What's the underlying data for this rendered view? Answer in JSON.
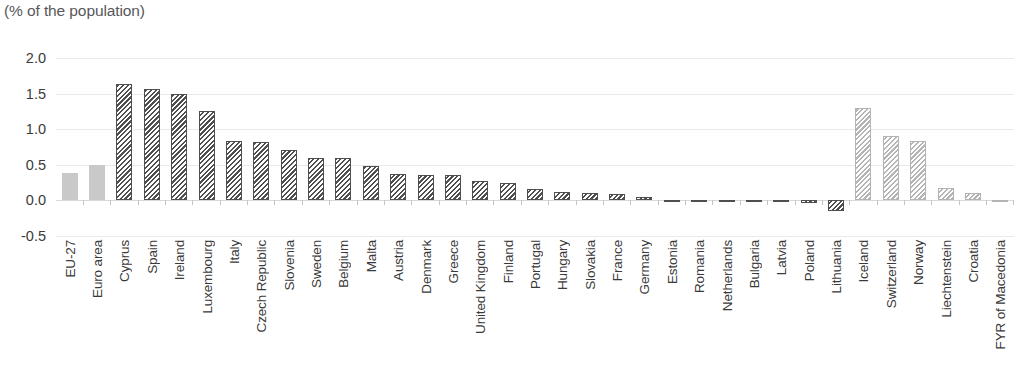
{
  "chart_data": {
    "type": "bar",
    "title": "(% of the population)",
    "xlabel": "",
    "ylabel": "",
    "ylim": [
      -0.5,
      2.0
    ],
    "ytick_labels": [
      "2.0",
      "1.5",
      "1.0",
      "0.5",
      "0.0",
      "-0.5"
    ],
    "ytick_values": [
      2.0,
      1.5,
      1.0,
      0.5,
      0.0,
      -0.5
    ],
    "grid": true,
    "legend_position": "none",
    "categories": [
      "EU-27",
      "Euro area",
      "Cyprus",
      "Spain",
      "Ireland",
      "Luxembourg",
      "Italy",
      "Czech Republic",
      "Slovenia",
      "Sweden",
      "Belgium",
      "Malta",
      "Austria",
      "Denmark",
      "Greece",
      "United Kingdom",
      "Finland",
      "Portugal",
      "Hungary",
      "Slovakia",
      "France",
      "Germany",
      "Estonia",
      "Romania",
      "Netherlands",
      "Bulgaria",
      "Latvia",
      "Poland",
      "Lithuania",
      "Iceland",
      "Switzerland",
      "Norway",
      "Liechtenstein",
      "Croatia",
      "FYR of Macedonia"
    ],
    "values": [
      0.39,
      0.5,
      1.63,
      1.57,
      1.5,
      1.26,
      0.84,
      0.82,
      0.71,
      0.6,
      0.59,
      0.49,
      0.37,
      0.36,
      0.35,
      0.27,
      0.25,
      0.16,
      0.12,
      0.11,
      0.09,
      0.05,
      0.01,
      0.0,
      -0.01,
      -0.01,
      -0.02,
      -0.03,
      -0.15,
      1.3,
      0.91,
      0.84,
      0.18,
      0.11,
      0.0
    ],
    "series_groups": [
      "aggregate",
      "aggregate",
      "member",
      "member",
      "member",
      "member",
      "member",
      "member",
      "member",
      "member",
      "member",
      "member",
      "member",
      "member",
      "member",
      "member",
      "member",
      "member",
      "member",
      "member",
      "member",
      "member",
      "member",
      "member",
      "member",
      "member",
      "member",
      "member",
      "member",
      "non-eu",
      "non-eu",
      "non-eu",
      "non-eu",
      "non-eu",
      "non-eu"
    ],
    "colors": {
      "aggregate": "#c9c9c9",
      "member": "#4f4f4f",
      "non_eu": "#b4b4b4",
      "gridline": "#e9e9e9",
      "text": "#3a3a3a",
      "title_text": "#58585a"
    }
  }
}
